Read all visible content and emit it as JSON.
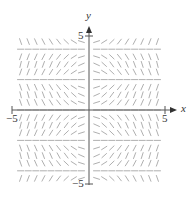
{
  "chart_data": {
    "type": "slope-field",
    "title": "",
    "xlabel": "x",
    "ylabel": "y",
    "xlim": [
      -5,
      5
    ],
    "ylim": [
      -5,
      5
    ],
    "x_ticks": [
      "-5",
      "5"
    ],
    "y_ticks": [
      "5",
      "-5"
    ],
    "grid": false,
    "grid_spacing": 0.5
  },
  "labels": {
    "x_axis": "x",
    "y_axis": "y",
    "x_min": "−5",
    "x_max": "5",
    "y_max": "5",
    "y_min": "−5"
  },
  "colors": {
    "segments": "#9a9a9a",
    "axes": "#555555"
  }
}
